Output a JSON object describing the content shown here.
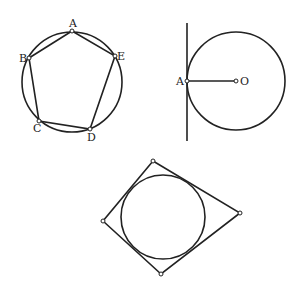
{
  "figures": [
    {
      "name": "inscribed-pentagon",
      "circle": {
        "cx": 72,
        "cy": 82,
        "r": 50
      },
      "points": [
        {
          "label": "A",
          "x": 72,
          "y": 31,
          "lx": 69,
          "ly": 27
        },
        {
          "label": "E",
          "x": 115,
          "y": 56,
          "lx": 117,
          "ly": 60
        },
        {
          "label": "D",
          "x": 90,
          "y": 129,
          "lx": 87,
          "ly": 141
        },
        {
          "label": "C",
          "x": 39,
          "y": 121,
          "lx": 33,
          "ly": 132
        },
        {
          "label": "B",
          "x": 29,
          "y": 58,
          "lx": 19,
          "ly": 62
        }
      ]
    },
    {
      "name": "tangent-line",
      "circle": {
        "cx": 236,
        "cy": 81,
        "r": 49
      },
      "line": {
        "x1": 187,
        "y1": 23,
        "x2": 187,
        "y2": 141
      },
      "points": [
        {
          "label": "A",
          "x": 187,
          "y": 81,
          "lx": 176,
          "ly": 85
        },
        {
          "label": "O",
          "x": 236,
          "y": 81,
          "lx": 240,
          "ly": 85
        }
      ]
    },
    {
      "name": "circumscribed-quadrilateral",
      "circle": {
        "cx": 163,
        "cy": 217,
        "r": 42
      },
      "points": [
        {
          "x": 153,
          "y": 161
        },
        {
          "x": 240,
          "y": 213
        },
        {
          "x": 161,
          "y": 274
        },
        {
          "x": 103,
          "y": 221
        }
      ]
    }
  ]
}
